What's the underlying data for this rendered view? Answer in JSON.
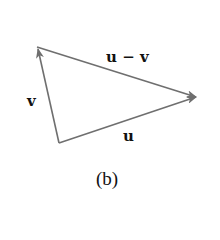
{
  "diagram": {
    "caption": "(b)",
    "colors": {
      "arrow": "#6f6f6f",
      "text": "#111111",
      "background": "#ffffff"
    },
    "vertices": {
      "origin": [
        59,
        143
      ],
      "v_tip": [
        37,
        47
      ],
      "u_tip": [
        198,
        97
      ]
    },
    "vectors": [
      {
        "id": "v",
        "label": "v",
        "from": "origin",
        "to": "v_tip"
      },
      {
        "id": "u",
        "label": "u",
        "from": "origin",
        "to": "u_tip"
      },
      {
        "id": "u_minus_v",
        "label": "u − v",
        "from": "v_tip",
        "to": "u_tip"
      }
    ],
    "labels": {
      "v": "v",
      "u": "u",
      "u_minus_v": "u − v"
    }
  }
}
